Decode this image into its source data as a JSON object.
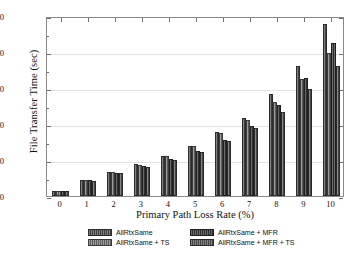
{
  "chart_data": {
    "type": "bar",
    "title": "",
    "xlabel": "Primary Path Loss Rate (%)",
    "ylabel": "File Transfer Time (sec)",
    "categories": [
      "0",
      "1",
      "2",
      "3",
      "4",
      "5",
      "6",
      "7",
      "8",
      "9",
      "10"
    ],
    "xtick_labels": [
      "0",
      "1",
      "2",
      "3",
      "4",
      "5",
      "6",
      "7",
      "8",
      "9",
      "10"
    ],
    "ytick_labels": [
      "0",
      "50",
      "100",
      "150",
      "200",
      "250"
    ],
    "yticks": [
      0,
      50,
      100,
      150,
      200,
      250
    ],
    "ylim": [
      0,
      250
    ],
    "grid": true,
    "grid_axis": "y",
    "legend_position": "below-axes",
    "legend_columns": 2,
    "series": [
      {
        "name": "AllRtxSame",
        "color": "#4a4a4a",
        "values": [
          7,
          22,
          33,
          44,
          55,
          69,
          89,
          109,
          141,
          181,
          239
        ]
      },
      {
        "name": "AllRtxSame + TS",
        "color": "#6b6b6b",
        "values": [
          7,
          22,
          33,
          43,
          55,
          69,
          87,
          105,
          130,
          163,
          198
        ]
      },
      {
        "name": "AllRtxSame + MFR",
        "color": "#3b3b3b",
        "values": [
          7,
          22,
          32,
          41,
          51,
          62,
          78,
          97,
          126,
          164,
          213
        ]
      },
      {
        "name": "AllRtxSame + MFR + TS",
        "color": "#555555",
        "values": [
          7,
          21,
          32,
          40,
          50,
          61,
          77,
          94,
          117,
          148,
          180
        ]
      }
    ]
  },
  "legend": {
    "entries": [
      "AllRtxSame",
      "AllRtxSame + TS",
      "AllRtxSame + MFR",
      "AllRtxSame + MFR + TS"
    ]
  }
}
